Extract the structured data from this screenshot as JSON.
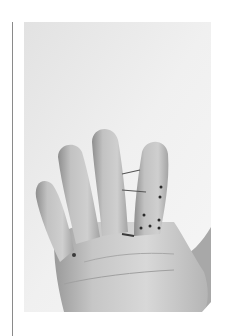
{
  "figure": {
    "colors": {
      "background": "#ececec",
      "skin_light": "#d9d9d9",
      "skin_mid": "#bdbdbd",
      "skin_dark": "#8f8f8f",
      "marker": "#2a2a2a",
      "rule": "#8a8a8a"
    },
    "annotations": {
      "lines": 2,
      "dots": 7
    }
  }
}
